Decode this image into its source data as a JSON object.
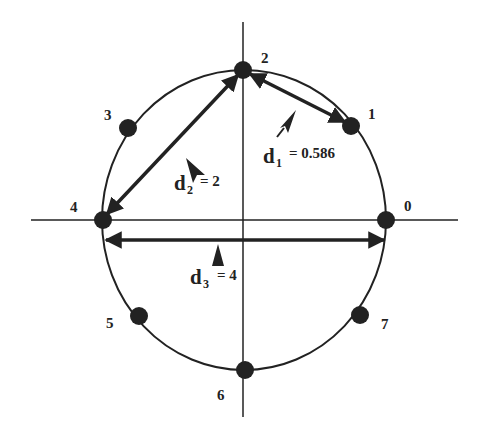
{
  "diagram": {
    "colors": {
      "ink": "#222222",
      "background": "#ffffff"
    },
    "axes": {
      "center": [
        244,
        220
      ],
      "horizontal": {
        "x1": 31,
        "x2": 458,
        "y": 220
      },
      "vertical": {
        "x": 243,
        "y1": 22,
        "y2": 417
      }
    },
    "circle": {
      "cx": 244,
      "cy": 220,
      "rx": 142,
      "ry": 150
    },
    "points": [
      {
        "id": 0,
        "label": "0",
        "x": 386,
        "y": 220,
        "label_x": 404,
        "label_y": 211
      },
      {
        "id": 1,
        "label": "1",
        "x": 351,
        "y": 126,
        "label_x": 368,
        "label_y": 119
      },
      {
        "id": 2,
        "label": "2",
        "x": 243,
        "y": 70,
        "label_x": 261,
        "label_y": 63
      },
      {
        "id": 3,
        "label": "3",
        "x": 128,
        "y": 128,
        "label_x": 104,
        "label_y": 120
      },
      {
        "id": 4,
        "label": "4",
        "x": 103,
        "y": 220,
        "label_x": 70,
        "label_y": 212
      },
      {
        "id": 5,
        "label": "5",
        "x": 139,
        "y": 316,
        "label_x": 106,
        "label_y": 328
      },
      {
        "id": 6,
        "label": "6",
        "x": 245,
        "y": 370,
        "label_x": 217,
        "label_y": 400
      },
      {
        "id": 7,
        "label": "7",
        "x": 360,
        "y": 315,
        "label_x": 381,
        "label_y": 329
      }
    ],
    "distances": [
      {
        "name": "d1",
        "symbol": "d",
        "subscript": "1",
        "equals": "= 0.586",
        "value": 0.586,
        "from": 2,
        "to": 1
      },
      {
        "name": "d2",
        "symbol": "d",
        "subscript": "2",
        "equals": "= 2",
        "value": 2,
        "from": 2,
        "to": 4
      },
      {
        "name": "d3",
        "symbol": "d",
        "subscript": "3",
        "equals": "= 4",
        "value": 4,
        "from": 4,
        "to": 0
      }
    ]
  }
}
